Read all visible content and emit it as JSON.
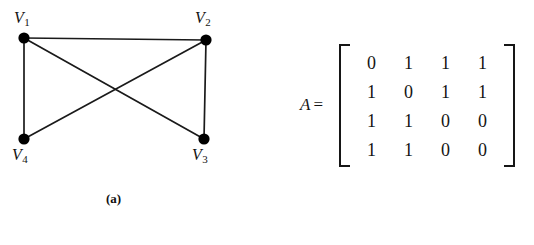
{
  "figure": {
    "panels": [
      {
        "id": "graph",
        "caption": "(a)",
        "type": "undirected-graph",
        "vertices": [
          {
            "id": "V1",
            "label": "V",
            "subscript": "1",
            "x": 24,
            "y": 38
          },
          {
            "id": "V2",
            "label": "V",
            "subscript": "2",
            "x": 206,
            "y": 40
          },
          {
            "id": "V3",
            "label": "V",
            "subscript": "3",
            "x": 204,
            "y": 139
          },
          {
            "id": "V4",
            "label": "V",
            "subscript": "4",
            "x": 24,
            "y": 139
          }
        ],
        "edges": [
          {
            "from": "V1",
            "to": "V2"
          },
          {
            "from": "V1",
            "to": "V4"
          },
          {
            "from": "V1",
            "to": "V3"
          },
          {
            "from": "V2",
            "to": "V3"
          },
          {
            "from": "V2",
            "to": "V4"
          }
        ],
        "style": {
          "vertex_radius": 5.5,
          "vertex_color": "#000000",
          "edge_color": "#1a1a1a",
          "edge_width": 1.6
        }
      },
      {
        "id": "matrix",
        "caption": "(b)",
        "type": "adjacency-matrix",
        "name": "A",
        "equals": "=",
        "rows": [
          [
            "0",
            "1",
            "1",
            "1"
          ],
          [
            "1",
            "0",
            "1",
            "1"
          ],
          [
            "1",
            "1",
            "0",
            "0"
          ],
          [
            "1",
            "1",
            "0",
            "0"
          ]
        ]
      }
    ]
  },
  "colors": {
    "background": "#ffffff",
    "ink": "#141414"
  }
}
